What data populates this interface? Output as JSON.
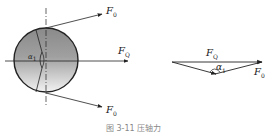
{
  "figure": {
    "left_diagram": {
      "shape": "circle",
      "labels": {
        "force_upper": {
          "main": "F",
          "sub": "0"
        },
        "force_right": {
          "main": "F",
          "sub": "Q"
        },
        "force_lower": {
          "main": "F",
          "sub": "0"
        },
        "angle": {
          "main": "α",
          "sub": "1"
        }
      }
    },
    "right_diagram": {
      "shape": "force-triangle",
      "labels": {
        "resultant": {
          "main": "F",
          "sub": "Q"
        },
        "angle": {
          "main": "α",
          "sub": "1"
        },
        "component": {
          "main": "F",
          "sub": "0"
        }
      }
    },
    "caption": "图 3-11  压轴力"
  },
  "colors": {
    "line": "#222222",
    "fill_top": "#8a8a8a",
    "fill_bottom": "#f2f2f2"
  }
}
